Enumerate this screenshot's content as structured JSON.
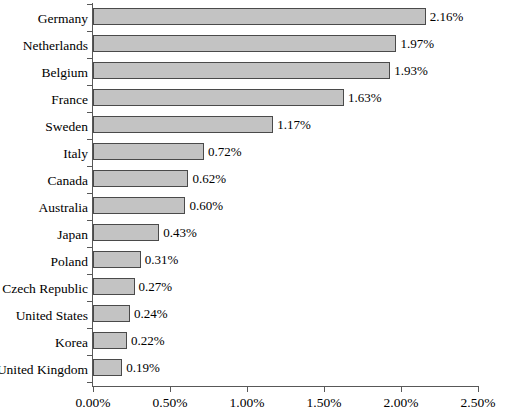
{
  "chart_data": {
    "type": "bar",
    "orientation": "horizontal",
    "title": "",
    "subtitle": "",
    "xlabel": "",
    "ylabel": "",
    "xlim": [
      0,
      2.5
    ],
    "grid": false,
    "legend": null,
    "value_format": "percent-2dp",
    "categories": [
      "Germany",
      "Netherlands",
      "Belgium",
      "France",
      "Sweden",
      "Italy",
      "Canada",
      "Australia",
      "Japan",
      "Poland",
      "Czech Republic",
      "United States",
      "Korea",
      "United Kingdom"
    ],
    "values": [
      2.16,
      1.97,
      1.93,
      1.63,
      1.17,
      0.72,
      0.62,
      0.6,
      0.43,
      0.31,
      0.27,
      0.24,
      0.22,
      0.19
    ],
    "data_labels": [
      "2.16%",
      "1.97%",
      "1.93%",
      "1.63%",
      "1.17%",
      "0.72%",
      "0.62%",
      "0.60%",
      "0.43%",
      "0.31%",
      "0.27%",
      "0.24%",
      "0.22%",
      "0.19%"
    ],
    "xticks": [
      0,
      0.5,
      1.0,
      1.5,
      2.0,
      2.5
    ],
    "xtick_labels": [
      "0.00%",
      "0.50%",
      "1.00%",
      "1.50%",
      "2.00%",
      "2.50%"
    ],
    "colors": {
      "bar_fill": "#c3c3c3",
      "bar_border": "#4a4a4a",
      "axis": "#585858",
      "text": "#000000",
      "background": "#ffffff"
    }
  }
}
